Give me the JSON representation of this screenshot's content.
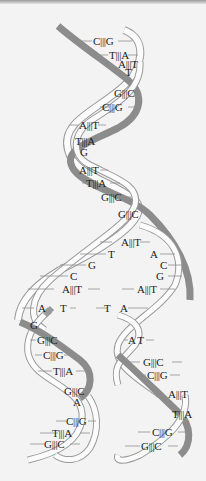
{
  "figure": {
    "colors": {
      "background": "#f3f3f3",
      "dark_strand": "#8c8c8c",
      "light_strand_outline": "#9a9a9a",
      "light_strand_fill": "#fbfbfb",
      "label_text": "#222222"
    },
    "parental_helix": {
      "base_pairs": [
        "C|||G",
        "T|||A",
        "A|||T",
        "T",
        "G|||C",
        "C|||G",
        "A|||T",
        "T|||A",
        "G",
        "A|||T",
        "T|||A",
        "G|||C",
        "G|||C"
      ]
    },
    "replication_fork": {
      "left_bases": [
        "A|||T",
        "T",
        "G",
        "C",
        "A|||T",
        "A",
        "T"
      ],
      "right_bases": [
        "A",
        "C",
        "G",
        "A|||T",
        "T",
        "A"
      ]
    },
    "daughter_left": {
      "base_pairs": [
        "G",
        "G|||C",
        "C|||G",
        "T|||A",
        "G|||C",
        "A",
        "C|||G",
        "T|||A",
        "G|||C"
      ]
    },
    "daughter_right": {
      "base_pairs": [
        "A T",
        "G|||C",
        "C|||G",
        "A|||T",
        "T|||A",
        "C|||G",
        "G|||C"
      ]
    }
  }
}
